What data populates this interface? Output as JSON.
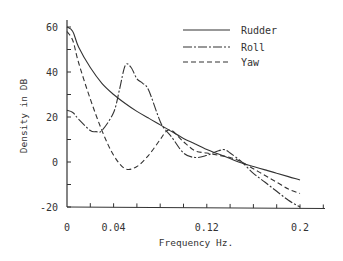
{
  "chart_data": {
    "type": "line",
    "title": "",
    "xlabel": "Frequency Hz.",
    "ylabel": "Density in DB",
    "xlim": [
      0,
      0.22
    ],
    "ylim": [
      -20,
      60
    ],
    "xticks": [
      0,
      0.04,
      0.12,
      0.2
    ],
    "xtick_labels": [
      "0",
      "0.04",
      "0.12",
      "0.2"
    ],
    "xminor_step": 0.02,
    "yticks": [
      -20,
      0,
      20,
      40,
      60
    ],
    "ytick_labels": [
      "-20",
      "0",
      "20",
      "40",
      "60"
    ],
    "yminor_step": 10,
    "grid": false,
    "legend_position": "upper right",
    "series": [
      {
        "name": "Rudder",
        "style": "solid",
        "x": [
          0,
          0.005,
          0.01,
          0.02,
          0.03,
          0.04,
          0.05,
          0.06,
          0.07,
          0.08,
          0.09,
          0.1,
          0.11,
          0.12,
          0.13,
          0.14,
          0.15,
          0.16,
          0.17,
          0.18,
          0.19,
          0.2
        ],
        "y": [
          60,
          58,
          51,
          42,
          35,
          30,
          26,
          22.5,
          19.5,
          16.5,
          13.5,
          10.5,
          8,
          5.5,
          3.5,
          1.5,
          -0.5,
          -2,
          -3.5,
          -5,
          -6.5,
          -8
        ]
      },
      {
        "name": "Roll",
        "style": "dash-dot",
        "x": [
          0,
          0.005,
          0.01,
          0.02,
          0.025,
          0.03,
          0.04,
          0.045,
          0.05,
          0.055,
          0.06,
          0.065,
          0.07,
          0.08,
          0.085,
          0.09,
          0.1,
          0.11,
          0.12,
          0.13,
          0.135,
          0.14,
          0.15,
          0.16,
          0.17,
          0.18,
          0.19,
          0.2
        ],
        "y": [
          23,
          22,
          19,
          14,
          13.5,
          14,
          22,
          32,
          43,
          42,
          37,
          35,
          32,
          18,
          14,
          11,
          4,
          2,
          3,
          5,
          5.5,
          4,
          0,
          -5,
          -9,
          -13,
          -17,
          -20
        ]
      },
      {
        "name": "Yaw",
        "style": "dashed",
        "x": [
          0,
          0.005,
          0.01,
          0.02,
          0.03,
          0.04,
          0.05,
          0.06,
          0.07,
          0.08,
          0.085,
          0.09,
          0.1,
          0.11,
          0.12,
          0.13,
          0.14,
          0.15,
          0.16,
          0.17,
          0.18,
          0.19,
          0.2
        ],
        "y": [
          58,
          54,
          44,
          28,
          14,
          3,
          -3,
          -2,
          3,
          10,
          13.5,
          14,
          9,
          5,
          4,
          3,
          2,
          0,
          -3,
          -6,
          -9,
          -12,
          -14
        ]
      }
    ]
  }
}
